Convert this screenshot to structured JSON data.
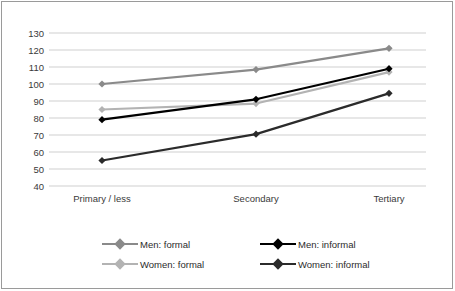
{
  "chart_data": {
    "type": "line",
    "title": "",
    "xlabel": "",
    "ylabel": "",
    "categories": [
      "Primary / less",
      "Secondary",
      "Tertiary"
    ],
    "ylim": [
      40,
      130
    ],
    "yticks": [
      40,
      50,
      60,
      70,
      80,
      90,
      100,
      110,
      120,
      130
    ],
    "ytick_labels": [
      "40",
      "50",
      "60",
      "70",
      "80",
      "90",
      "100",
      "110",
      "120",
      "130"
    ],
    "grid": "horizontal",
    "legend_position": "bottom",
    "marker": "diamond",
    "series": [
      {
        "name": "Men: formal",
        "values": [
          100,
          108.5,
          121
        ],
        "color": "#8a8a8a"
      },
      {
        "name": "Women: formal",
        "values": [
          85,
          88.5,
          107
        ],
        "color": "#b3b3b3"
      },
      {
        "name": "Men: informal",
        "values": [
          79,
          91,
          109
        ],
        "color": "#000000"
      },
      {
        "name": "Women: informal",
        "values": [
          55,
          70.5,
          94.5
        ],
        "color": "#2b2b2b"
      }
    ]
  },
  "axis": {
    "ytick_0": "130",
    "ytick_1": "120",
    "ytick_2": "110",
    "ytick_3": "100",
    "ytick_4": "90",
    "ytick_5": "80",
    "ytick_6": "70",
    "ytick_7": "60",
    "ytick_8": "50",
    "ytick_9": "40",
    "cat_0": "Primary / less",
    "cat_1": "Secondary",
    "cat_2": "Tertiary"
  },
  "legend": {
    "entries": [
      {
        "label": "Men: formal",
        "color": "#8a8a8a"
      },
      {
        "label": "Women: formal",
        "color": "#b3b3b3"
      },
      {
        "label": "Men: informal",
        "color": "#000000"
      },
      {
        "label": "Women: informal",
        "color": "#2b2b2b"
      }
    ]
  },
  "style": {
    "gridline_color": "#cfcfcf",
    "border_color": "#9a9a9a",
    "background": "#ffffff"
  }
}
